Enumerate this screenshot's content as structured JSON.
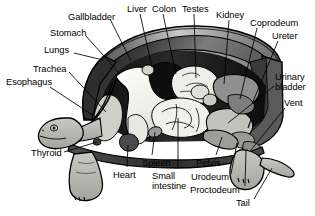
{
  "figure": {
    "width": 315,
    "height": 216,
    "background_color": "#ffffff",
    "line_color": "#000000",
    "palette": {
      "carapace_dark": "#3c3c3c",
      "carapace_mid": "#8a8a8a",
      "carapace_light": "#d8d8d8",
      "body_cavity_black": "#111111",
      "lung_white": "#f4f4f0",
      "organ_gray": "#b4b4b4",
      "organ_dark_gray": "#6e6e6e",
      "skin_gray": "#b9b9b4",
      "intestine_light": "#eeeeea"
    }
  },
  "labels": [
    {
      "id": "gallbladder",
      "text": "Gallbladder",
      "lines": [
        "Gallbladder"
      ],
      "x": 68,
      "y": 12,
      "align": "left",
      "target": {
        "x": 131,
        "y": 61
      }
    },
    {
      "id": "liver",
      "text": "Liver",
      "lines": [
        "Liver"
      ],
      "x": 127,
      "y": 4,
      "align": "left",
      "target": {
        "x": 152,
        "y": 67
      }
    },
    {
      "id": "colon",
      "text": "Colon",
      "lines": [
        "Colon"
      ],
      "x": 152,
      "y": 4,
      "align": "left",
      "target": {
        "x": 176,
        "y": 74
      }
    },
    {
      "id": "testes",
      "text": "Testes",
      "lines": [
        "Testes"
      ],
      "x": 182,
      "y": 4,
      "align": "left",
      "target": {
        "x": 196,
        "y": 78
      }
    },
    {
      "id": "kidney",
      "text": "Kidney",
      "lines": [
        "Kidney"
      ],
      "x": 216,
      "y": 10,
      "align": "left",
      "target": {
        "x": 224,
        "y": 84
      }
    },
    {
      "id": "coprodeum",
      "text": "Coprodeum",
      "lines": [
        "Coprodeum"
      ],
      "x": 250,
      "y": 18,
      "align": "left",
      "target": {
        "x": 240,
        "y": 99
      }
    },
    {
      "id": "ureter",
      "text": "Ureter",
      "lines": [
        "Ureter"
      ],
      "x": 272,
      "y": 31,
      "align": "left",
      "target": {
        "x": 252,
        "y": 104
      }
    },
    {
      "id": "urinary_bladder",
      "text": "Urinary bladder",
      "lines": [
        "Urinary",
        "bladder"
      ],
      "x": 275,
      "y": 72,
      "align": "left",
      "target": {
        "x": 228,
        "y": 123
      }
    },
    {
      "id": "vent",
      "text": "Vent",
      "lines": [
        "Vent"
      ],
      "x": 284,
      "y": 98,
      "align": "left",
      "target": {
        "x": 251,
        "y": 150
      }
    },
    {
      "id": "stomach",
      "text": "Stomach",
      "lines": [
        "Stomach"
      ],
      "x": 50,
      "y": 28,
      "align": "left",
      "target": {
        "x": 119,
        "y": 73
      }
    },
    {
      "id": "lungs",
      "text": "Lungs",
      "lines": [
        "Lungs"
      ],
      "x": 44,
      "y": 45,
      "align": "left",
      "target": {
        "x": 103,
        "y": 60
      }
    },
    {
      "id": "trachea",
      "text": "Trachea",
      "lines": [
        "Trachea"
      ],
      "x": 33,
      "y": 64,
      "align": "left",
      "target": {
        "x": 106,
        "y": 112
      }
    },
    {
      "id": "esophagus",
      "text": "Esophagus",
      "lines": [
        "Esophagus"
      ],
      "x": 6,
      "y": 77,
      "align": "left",
      "target": {
        "x": 100,
        "y": 120
      }
    },
    {
      "id": "thyroid",
      "text": "Thyroid",
      "lines": [
        "Thyroid"
      ],
      "x": 31,
      "y": 148,
      "align": "left",
      "target": {
        "x": 97,
        "y": 142
      }
    },
    {
      "id": "heart",
      "text": "Heart",
      "lines": [
        "Heart"
      ],
      "x": 113,
      "y": 170,
      "align": "left",
      "target": {
        "x": 128,
        "y": 145
      }
    },
    {
      "id": "spleen",
      "text": "Spleen",
      "lines": [
        "Spleen"
      ],
      "x": 142,
      "y": 158,
      "align": "left",
      "target": {
        "x": 155,
        "y": 132
      }
    },
    {
      "id": "small_intestine",
      "text": "Small intestine",
      "lines": [
        "Small",
        "intestine"
      ],
      "x": 152,
      "y": 171,
      "align": "left",
      "target": {
        "x": 178,
        "y": 118
      }
    },
    {
      "id": "pelvis",
      "text": "Pelvis",
      "lines": [
        "Pelvis"
      ],
      "x": 196,
      "y": 158,
      "align": "left",
      "target": {
        "x": 222,
        "y": 137
      }
    },
    {
      "id": "urodeum",
      "text": "Urodeum",
      "lines": [
        "Urodeum"
      ],
      "x": 191,
      "y": 172,
      "align": "left",
      "target": {
        "x": 237,
        "y": 143
      }
    },
    {
      "id": "proctodeum",
      "text": "Proctodeum",
      "lines": [
        "Proctodeum"
      ],
      "x": 190,
      "y": 185,
      "align": "left",
      "target": {
        "x": 246,
        "y": 150
      }
    },
    {
      "id": "tail",
      "text": "Tail",
      "lines": [
        "Tail"
      ],
      "x": 236,
      "y": 198,
      "align": "left",
      "target": {
        "x": 272,
        "y": 168
      }
    }
  ]
}
